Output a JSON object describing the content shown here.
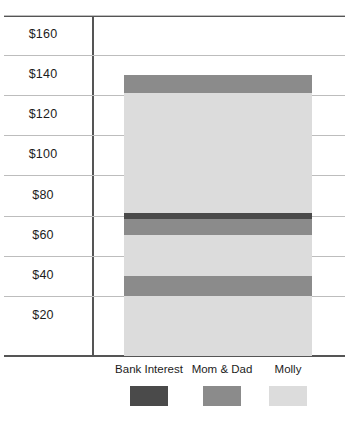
{
  "chart_data": {
    "type": "bar",
    "subtype": "stacked-bar-single-category",
    "title": "",
    "xlabel": "",
    "ylabel": "",
    "categories": [
      "Savings"
    ],
    "ylim": [
      0,
      170
    ],
    "ytick_values": [
      20,
      40,
      60,
      80,
      100,
      120,
      140,
      160
    ],
    "ytick_labels": [
      "$20",
      "$40",
      "$60",
      "$80",
      "$100",
      "$120",
      "$140",
      "$160"
    ],
    "grid": true,
    "legend_position": "bottom",
    "series": [
      {
        "name": "Bank Interest",
        "color": "#4a4a4a",
        "values": [
          3
        ]
      },
      {
        "name": "Mom & Dad",
        "color": "#8b8b8b",
        "values": [
          26
        ]
      },
      {
        "name": "Molly",
        "color": "#dcdcdc",
        "values": [
          111
        ]
      }
    ],
    "total": 140,
    "stack_segments": [
      {
        "series": "Molly",
        "color": "#dcdcdc",
        "from": 0,
        "to": 30
      },
      {
        "series": "Mom & Dad",
        "color": "#8b8b8b",
        "from": 30,
        "to": 40
      },
      {
        "series": "Molly",
        "color": "#dcdcdc",
        "from": 40,
        "to": 60
      },
      {
        "series": "Mom & Dad",
        "color": "#8b8b8b",
        "from": 60,
        "to": 68
      },
      {
        "series": "Bank Interest",
        "color": "#4a4a4a",
        "from": 68,
        "to": 71
      },
      {
        "series": "Molly",
        "color": "#dcdcdc",
        "from": 71,
        "to": 131
      },
      {
        "series": "Mom & Dad",
        "color": "#8b8b8b",
        "from": 131,
        "to": 140
      }
    ]
  },
  "axis": {
    "ticks": [
      {
        "label": "$160"
      },
      {
        "label": "$140"
      },
      {
        "label": "$120"
      },
      {
        "label": "$100"
      },
      {
        "label": "$80"
      },
      {
        "label": "$60"
      },
      {
        "label": "$40"
      },
      {
        "label": "$20"
      }
    ]
  },
  "legend": {
    "items": [
      {
        "label": "Bank Interest",
        "color": "#4a4a4a"
      },
      {
        "label": "Mom & Dad",
        "color": "#8b8b8b"
      },
      {
        "label": "Molly",
        "color": "#dcdcdc"
      }
    ]
  },
  "colors": {
    "bank_interest": "#4a4a4a",
    "mom_and_dad": "#8b8b8b",
    "molly": "#dcdcdc",
    "axis": "#555555",
    "gridline": "#bdbdbd",
    "background": "#ffffff"
  }
}
